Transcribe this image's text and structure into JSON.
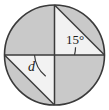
{
  "figure": {
    "kind": "geometry-diagram",
    "labels": {
      "angle_top_right": "15°",
      "angle_bottom_left": "d"
    },
    "colors": {
      "shaded_fill": "#c9c9c9",
      "unshaded_fill": "#f2f2f2",
      "stroke": "#3a3a3a",
      "label_text": "#1c1c1c",
      "background": "#ffffff"
    },
    "geometry": {
      "center": [
        54.5,
        55
      ],
      "radius": 50,
      "points": {
        "top": [
          54.5,
          5
        ],
        "bottom": [
          54.5,
          105
        ],
        "left": [
          4.5,
          55
        ],
        "right": [
          104.5,
          55
        ]
      },
      "chords": [
        {
          "name": "top-chord",
          "from": "top",
          "to": "right"
        },
        {
          "name": "bottom-chord",
          "from": "left",
          "to": "bottom"
        }
      ],
      "angles": [
        {
          "label": "15°",
          "vertex": "right",
          "value": 15,
          "unit": "degrees"
        },
        {
          "label": "d",
          "vertex": "left",
          "value": null,
          "unit": "degrees"
        }
      ]
    }
  }
}
